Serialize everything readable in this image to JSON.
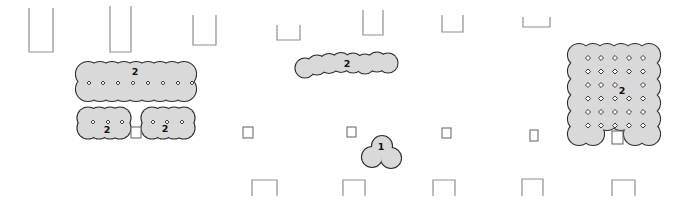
{
  "figure": {
    "canvas": {
      "width": 675,
      "height": 202
    },
    "styles": {
      "background": "#ffffff",
      "blob_fill": "#d9d9d9",
      "blob_stroke": "#2e2e2e",
      "marker_fill": "#ffffff",
      "marker_stroke": "#333333",
      "structure_stroke": "#8f8f8f",
      "square_stroke": "#6e6e6e",
      "label_color": "#111111"
    },
    "blobs": [
      {
        "id": "a",
        "label": "2",
        "label_x": 135,
        "label_y": 71,
        "label_size": 9.5,
        "r": 12,
        "marker_size": 2.8,
        "circles": [
          [
            88,
            74
          ],
          [
            100,
            74
          ],
          [
            112,
            74
          ],
          [
            124,
            74
          ],
          [
            136,
            74
          ],
          [
            148,
            74
          ],
          [
            160,
            74
          ],
          [
            172,
            74
          ],
          [
            184,
            74
          ],
          [
            88,
            89
          ],
          [
            100,
            89
          ],
          [
            112,
            89
          ],
          [
            124,
            89
          ],
          [
            136,
            89
          ],
          [
            148,
            89
          ],
          [
            160,
            89
          ],
          [
            172,
            89
          ],
          [
            184,
            89
          ]
        ],
        "markers": [
          [
            89,
            83
          ],
          [
            103,
            83
          ],
          [
            118,
            83
          ],
          [
            133,
            83
          ],
          [
            148,
            83
          ],
          [
            163,
            83
          ],
          [
            178,
            83
          ],
          [
            192,
            83
          ]
        ]
      },
      {
        "id": "b",
        "label": "2",
        "label_x": 107,
        "label_y": 129,
        "label_size": 9.5,
        "r": 10.5,
        "marker_size": 2.8,
        "circles": [
          [
            88,
            118
          ],
          [
            99,
            118
          ],
          [
            110,
            118
          ],
          [
            120,
            118
          ],
          [
            88,
            128
          ],
          [
            99,
            128
          ],
          [
            110,
            128
          ],
          [
            120,
            128
          ]
        ],
        "markers": [
          [
            93,
            122
          ],
          [
            108,
            122
          ],
          [
            122,
            122
          ]
        ]
      },
      {
        "id": "c",
        "label": "2",
        "label_x": 165,
        "label_y": 128,
        "label_size": 9.5,
        "r": 10.5,
        "marker_size": 2.8,
        "circles": [
          [
            152,
            118
          ],
          [
            163,
            118
          ],
          [
            174,
            118
          ],
          [
            184,
            118
          ],
          [
            152,
            128
          ],
          [
            163,
            128
          ],
          [
            174,
            128
          ],
          [
            184,
            128
          ]
        ],
        "markers": [
          [
            153,
            122
          ],
          [
            167,
            122
          ],
          [
            182,
            122
          ]
        ]
      },
      {
        "id": "d",
        "label": "2",
        "label_x": 347,
        "label_y": 63,
        "label_size": 9.5,
        "r": 9.5,
        "marker_size": 2.8,
        "circles": [
          [
            305,
            68
          ],
          [
            317,
            65
          ],
          [
            329,
            63.5
          ],
          [
            341,
            62.5
          ],
          [
            353,
            63
          ],
          [
            365,
            64
          ],
          [
            377,
            62
          ],
          [
            388,
            63
          ]
        ],
        "markers": []
      },
      {
        "id": "e",
        "label": "1",
        "label_x": 381,
        "label_y": 146,
        "label_size": 9.5,
        "r": 10,
        "marker_size": 2.8,
        "circles": [
          [
            382,
            146
          ],
          [
            372,
            157
          ],
          [
            391,
            158
          ]
        ],
        "markers": []
      },
      {
        "id": "f",
        "label": "2",
        "label_x": 622,
        "label_y": 90,
        "label_size": 9.5,
        "r": 11,
        "marker_size": 3.6,
        "circles": [
          [
            579,
            55
          ],
          [
            593,
            55
          ],
          [
            607,
            55
          ],
          [
            621,
            55
          ],
          [
            635,
            55
          ],
          [
            649,
            55
          ],
          [
            579,
            71
          ],
          [
            593,
            71
          ],
          [
            607,
            71
          ],
          [
            621,
            71
          ],
          [
            635,
            71
          ],
          [
            649,
            71
          ],
          [
            579,
            87
          ],
          [
            593,
            87
          ],
          [
            607,
            87
          ],
          [
            621,
            87
          ],
          [
            635,
            87
          ],
          [
            649,
            87
          ],
          [
            579,
            103
          ],
          [
            593,
            103
          ],
          [
            607,
            103
          ],
          [
            621,
            103
          ],
          [
            635,
            103
          ],
          [
            649,
            103
          ],
          [
            579,
            119
          ],
          [
            593,
            119
          ],
          [
            607,
            119
          ],
          [
            621,
            119
          ],
          [
            635,
            119
          ],
          [
            649,
            119
          ],
          [
            579,
            134
          ],
          [
            593,
            134
          ],
          [
            635,
            134
          ],
          [
            649,
            134
          ]
        ],
        "markers": [
          [
            588,
            58
          ],
          [
            601,
            58
          ],
          [
            615,
            58
          ],
          [
            629,
            58
          ],
          [
            643,
            58
          ],
          [
            588,
            71.5
          ],
          [
            601,
            71.5
          ],
          [
            615,
            71.5
          ],
          [
            629,
            71.5
          ],
          [
            643,
            71.5
          ],
          [
            588,
            85
          ],
          [
            601,
            85
          ],
          [
            615,
            85
          ],
          [
            643,
            85
          ],
          [
            588,
            98.5
          ],
          [
            601,
            98.5
          ],
          [
            615,
            98.5
          ],
          [
            629,
            98.5
          ],
          [
            643,
            98.5
          ],
          [
            588,
            112
          ],
          [
            601,
            112
          ],
          [
            615,
            112
          ],
          [
            629,
            112
          ],
          [
            643,
            112
          ],
          [
            588,
            125.5
          ],
          [
            601,
            125.5
          ],
          [
            615,
            125.5
          ],
          [
            629,
            125.5
          ],
          [
            643,
            125.5
          ]
        ]
      }
    ],
    "open_top_rects": [
      {
        "x": 29,
        "y": 8,
        "w": 24,
        "h": 44
      },
      {
        "x": 110,
        "y": 6,
        "w": 21,
        "h": 46
      },
      {
        "x": 193,
        "y": 15,
        "w": 23,
        "h": 30
      },
      {
        "x": 277,
        "y": 25,
        "w": 23,
        "h": 15
      },
      {
        "x": 363,
        "y": 10,
        "w": 20,
        "h": 25
      },
      {
        "x": 442,
        "y": 15,
        "w": 21,
        "h": 17
      },
      {
        "x": 523,
        "y": 17,
        "w": 27,
        "h": 10
      }
    ],
    "open_bottom_rects": [
      {
        "x": 252,
        "y": 180,
        "w": 25,
        "h": 16
      },
      {
        "x": 343,
        "y": 180,
        "w": 22,
        "h": 16
      },
      {
        "x": 433,
        "y": 180,
        "w": 22,
        "h": 16
      },
      {
        "x": 522,
        "y": 179,
        "w": 21,
        "h": 17
      },
      {
        "x": 612,
        "y": 180,
        "w": 23,
        "h": 16
      }
    ],
    "small_squares": [
      {
        "x": 131,
        "y": 127,
        "w": 10,
        "h": 11
      },
      {
        "x": 243,
        "y": 127,
        "w": 10,
        "h": 11
      },
      {
        "x": 347,
        "y": 127,
        "w": 9,
        "h": 10
      },
      {
        "x": 442,
        "y": 128,
        "w": 9,
        "h": 10
      },
      {
        "x": 530,
        "y": 130,
        "w": 8,
        "h": 11
      },
      {
        "x": 612,
        "y": 131,
        "w": 11,
        "h": 13
      }
    ]
  }
}
